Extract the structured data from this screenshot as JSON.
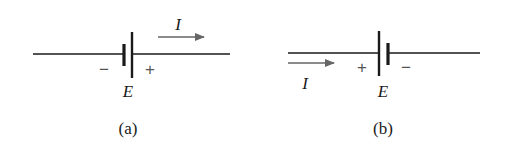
{
  "figure": {
    "panels": [
      {
        "id": "a",
        "caption": "(a)",
        "battery_label": "E",
        "current_label": "I",
        "left_terminal_sign": "−",
        "right_terminal_sign": "+",
        "current_direction": "right",
        "current_arrow_position": "above-right",
        "plate_order": [
          "short-negative",
          "long-positive"
        ]
      },
      {
        "id": "b",
        "caption": "(b)",
        "battery_label": "E",
        "current_label": "I",
        "left_terminal_sign": "+",
        "right_terminal_sign": "−",
        "current_direction": "right",
        "current_arrow_position": "below-left",
        "plate_order": [
          "long-positive",
          "short-negative"
        ]
      }
    ],
    "colors": {
      "wire": "#1a1a1a",
      "arrow": "#666666",
      "sign": "#555555",
      "background": "#ffffff"
    }
  }
}
